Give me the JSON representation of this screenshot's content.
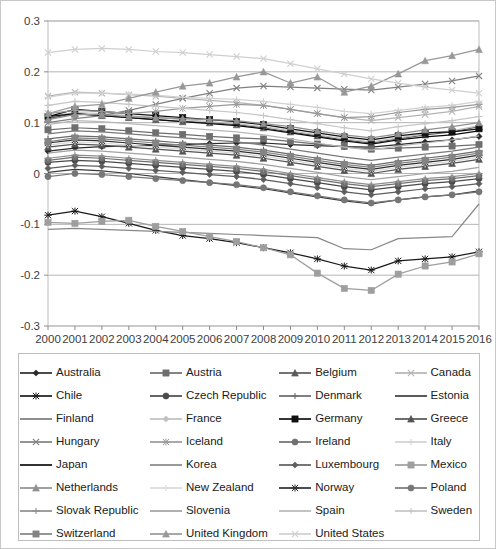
{
  "chart_data": {
    "type": "line",
    "title": "",
    "subtitle": "",
    "xlabel": "",
    "ylabel": "",
    "grid": true,
    "legend_position": "bottom",
    "xlim": [
      2000,
      2016
    ],
    "ylim": [
      -0.3,
      0.3
    ],
    "ytick_labels": [
      "0.3",
      "0.2",
      "0.1",
      "0",
      "-0.1",
      "-0.2",
      "-0.3"
    ],
    "ytick_values": [
      0.3,
      0.2,
      0.1,
      0,
      -0.1,
      -0.2,
      -0.3
    ],
    "categories": [
      2000,
      2001,
      2002,
      2003,
      2004,
      2005,
      2006,
      2007,
      2008,
      2009,
      2010,
      2011,
      2012,
      2013,
      2014,
      2015,
      2016
    ],
    "xtick_labels": [
      "2000",
      "2001",
      "2002",
      "2003",
      "2004",
      "2005",
      "2006",
      "2007",
      "2008",
      "2009",
      "2010",
      "2011",
      "2012",
      "2013",
      "2014",
      "2015",
      "2016"
    ],
    "series": [
      {
        "name": "Australia",
        "marker": "diamond",
        "color": "#2b2b2b",
        "values": [
          0.044,
          0.05,
          0.053,
          0.054,
          0.056,
          0.057,
          0.059,
          0.06,
          0.06,
          0.057,
          0.055,
          0.053,
          0.052,
          0.057,
          0.062,
          0.066,
          0.073
        ]
      },
      {
        "name": "Austria",
        "marker": "square",
        "color": "#6e6e6e",
        "values": [
          0.086,
          0.09,
          0.088,
          0.084,
          0.08,
          0.077,
          0.073,
          0.07,
          0.068,
          0.063,
          0.058,
          0.053,
          0.048,
          0.05,
          0.052,
          0.054,
          0.057
        ]
      },
      {
        "name": "Belgium",
        "marker": "triangle",
        "color": "#5a5a5a",
        "values": [
          0.108,
          0.118,
          0.114,
          0.11,
          0.106,
          0.102,
          0.1,
          0.096,
          0.09,
          0.082,
          0.074,
          0.066,
          0.06,
          0.068,
          0.076,
          0.082,
          0.092
        ]
      },
      {
        "name": "Canada",
        "marker": "x",
        "color": "#b4b4b4",
        "values": [
          0.152,
          0.16,
          0.158,
          0.155,
          0.152,
          0.148,
          0.144,
          0.14,
          0.134,
          0.126,
          0.118,
          0.11,
          0.104,
          0.11,
          0.116,
          0.122,
          0.132
        ]
      },
      {
        "name": "Chile",
        "marker": "star",
        "color": "#1a1a1a",
        "values": [
          -0.082,
          -0.074,
          -0.085,
          -0.098,
          -0.112,
          -0.122,
          -0.128,
          -0.136,
          -0.146,
          -0.156,
          -0.168,
          -0.182,
          -0.19,
          -0.172,
          -0.168,
          -0.164,
          -0.154
        ]
      },
      {
        "name": "Czech Republic",
        "marker": "circle",
        "color": "#4a4a4a",
        "values": [
          0.022,
          0.026,
          0.024,
          0.02,
          0.016,
          0.012,
          0.008,
          0.004,
          -0.002,
          -0.01,
          -0.018,
          -0.026,
          -0.032,
          -0.026,
          -0.02,
          -0.016,
          -0.01
        ]
      },
      {
        "name": "Denmark",
        "marker": "plus",
        "color": "#6a6a6a",
        "values": [
          0.068,
          0.074,
          0.072,
          0.068,
          0.064,
          0.06,
          0.056,
          0.052,
          0.046,
          0.038,
          0.03,
          0.022,
          0.016,
          0.024,
          0.03,
          0.036,
          0.044
        ]
      },
      {
        "name": "Estonia",
        "marker": "none",
        "color": "#3c3c3c",
        "values": [
          0.002,
          0.008,
          0.005,
          0.0,
          -0.006,
          -0.012,
          -0.018,
          -0.024,
          -0.03,
          -0.038,
          -0.046,
          -0.054,
          -0.06,
          -0.052,
          -0.046,
          -0.042,
          -0.034
        ]
      },
      {
        "name": "Finland",
        "marker": "none",
        "color": "#7a7a7a",
        "values": [
          0.078,
          0.084,
          0.082,
          0.078,
          0.074,
          0.07,
          0.066,
          0.062,
          0.056,
          0.048,
          0.04,
          0.032,
          0.026,
          0.032,
          0.038,
          0.044,
          0.052
        ]
      },
      {
        "name": "France",
        "marker": "diamond",
        "color": "#c0c0c0",
        "values": [
          0.112,
          0.12,
          0.118,
          0.114,
          0.11,
          0.106,
          0.102,
          0.098,
          0.092,
          0.084,
          0.076,
          0.068,
          0.062,
          0.07,
          0.078,
          0.084,
          0.094
        ]
      },
      {
        "name": "Germany",
        "marker": "square",
        "color": "#111111",
        "values": [
          0.112,
          0.126,
          0.122,
          0.118,
          0.114,
          0.11,
          0.106,
          0.102,
          0.096,
          0.088,
          0.08,
          0.072,
          0.066,
          0.074,
          0.08,
          0.082,
          0.088
        ]
      },
      {
        "name": "Greece",
        "marker": "triangle",
        "color": "#545454",
        "values": [
          0.052,
          0.058,
          0.056,
          0.052,
          0.048,
          0.044,
          0.04,
          0.036,
          0.03,
          0.022,
          0.014,
          0.006,
          0.0,
          0.008,
          0.014,
          0.02,
          0.028
        ]
      },
      {
        "name": "Hungary",
        "marker": "x",
        "color": "#808080",
        "values": [
          0.1,
          0.108,
          0.114,
          0.124,
          0.136,
          0.148,
          0.158,
          0.168,
          0.172,
          0.17,
          0.168,
          0.166,
          0.164,
          0.17,
          0.176,
          0.182,
          0.192
        ]
      },
      {
        "name": "Iceland",
        "marker": "star",
        "color": "#9a9a9a",
        "values": [
          0.118,
          0.124,
          0.122,
          0.118,
          0.122,
          0.128,
          0.132,
          0.136,
          0.134,
          0.126,
          0.118,
          0.11,
          0.112,
          0.12,
          0.126,
          0.13,
          0.136
        ]
      },
      {
        "name": "Ireland",
        "marker": "circle",
        "color": "#707070",
        "values": [
          0.026,
          0.032,
          0.03,
          0.026,
          0.022,
          0.018,
          0.014,
          0.01,
          0.004,
          -0.004,
          -0.012,
          -0.02,
          -0.026,
          -0.02,
          -0.014,
          -0.01,
          -0.004
        ]
      },
      {
        "name": "Italy",
        "marker": "plus",
        "color": "#d2d2d2",
        "values": [
          0.15,
          0.158,
          0.158,
          0.156,
          0.154,
          0.15,
          0.148,
          0.146,
          0.142,
          0.136,
          0.13,
          0.122,
          0.118,
          0.124,
          0.13,
          0.134,
          0.142
        ]
      },
      {
        "name": "Japan",
        "marker": "none",
        "color": "#0d0d0d",
        "values": [
          0.112,
          0.118,
          0.114,
          0.11,
          0.106,
          0.102,
          0.098,
          0.094,
          0.088,
          0.08,
          0.072,
          0.064,
          0.058,
          0.066,
          0.072,
          0.076,
          0.084
        ]
      },
      {
        "name": "Korea",
        "marker": "none",
        "color": "#888888",
        "values": [
          -0.11,
          -0.108,
          -0.11,
          -0.112,
          -0.114,
          -0.116,
          -0.118,
          -0.12,
          -0.122,
          -0.124,
          -0.126,
          -0.148,
          -0.15,
          -0.128,
          -0.126,
          -0.124,
          -0.06
        ]
      },
      {
        "name": "Luxembourg",
        "marker": "diamond",
        "color": "#5e5e5e",
        "values": [
          0.01,
          0.016,
          0.014,
          0.01,
          0.006,
          0.002,
          -0.002,
          -0.006,
          -0.012,
          -0.02,
          -0.028,
          -0.036,
          -0.042,
          -0.036,
          -0.03,
          -0.026,
          -0.02
        ]
      },
      {
        "name": "Mexico",
        "marker": "square",
        "color": "#9e9e9e",
        "values": [
          -0.096,
          -0.098,
          -0.094,
          -0.092,
          -0.104,
          -0.114,
          -0.124,
          -0.134,
          -0.146,
          -0.16,
          -0.196,
          -0.226,
          -0.23,
          -0.198,
          -0.182,
          -0.174,
          -0.158
        ]
      },
      {
        "name": "Netherlands",
        "marker": "triangle",
        "color": "#909090",
        "values": [
          0.106,
          0.116,
          0.116,
          0.112,
          0.11,
          0.108,
          0.106,
          0.104,
          0.098,
          0.092,
          0.084,
          0.076,
          0.07,
          0.078,
          0.086,
          0.092,
          0.1
        ]
      },
      {
        "name": "New Zealand",
        "marker": "plus",
        "color": "#dadada",
        "values": [
          0.056,
          0.062,
          0.06,
          0.056,
          0.052,
          0.048,
          0.044,
          0.04,
          0.034,
          0.026,
          0.018,
          0.01,
          0.004,
          0.012,
          0.018,
          0.024,
          0.032
        ]
      },
      {
        "name": "Norway",
        "marker": "star",
        "color": "#2e2e2e",
        "values": [
          0.06,
          0.066,
          0.064,
          0.06,
          0.056,
          0.052,
          0.048,
          0.044,
          0.038,
          0.03,
          0.022,
          0.014,
          0.008,
          0.016,
          0.022,
          0.028,
          0.036
        ]
      },
      {
        "name": "Poland",
        "marker": "circle",
        "color": "#767676",
        "values": [
          -0.006,
          0.0,
          -0.002,
          -0.006,
          -0.01,
          -0.014,
          -0.018,
          -0.022,
          -0.028,
          -0.036,
          -0.044,
          -0.052,
          -0.058,
          -0.052,
          -0.046,
          -0.042,
          -0.036
        ]
      },
      {
        "name": "Slovak Republic",
        "marker": "plus",
        "color": "#8e8e8e",
        "values": [
          0.03,
          0.036,
          0.034,
          0.03,
          0.026,
          0.022,
          0.018,
          0.014,
          0.008,
          0.0,
          -0.008,
          -0.016,
          -0.022,
          -0.016,
          -0.01,
          -0.006,
          0.0
        ]
      },
      {
        "name": "Slovenia",
        "marker": "none",
        "color": "#a2a2a2",
        "values": [
          0.04,
          0.046,
          0.044,
          0.04,
          0.036,
          0.032,
          0.028,
          0.024,
          0.018,
          0.01,
          0.002,
          -0.006,
          -0.012,
          -0.006,
          0.0,
          0.004,
          0.012
        ]
      },
      {
        "name": "Spain",
        "marker": "none",
        "color": "#b8b8b8",
        "values": [
          0.096,
          0.104,
          0.102,
          0.098,
          0.094,
          0.09,
          0.086,
          0.082,
          0.076,
          0.068,
          0.06,
          0.052,
          0.046,
          0.054,
          0.06,
          0.066,
          0.074
        ]
      },
      {
        "name": "Sweden",
        "marker": "plus",
        "color": "#c6c6c6",
        "values": [
          0.134,
          0.142,
          0.14,
          0.136,
          0.132,
          0.128,
          0.124,
          0.12,
          0.114,
          0.106,
          0.098,
          0.09,
          0.084,
          0.092,
          0.098,
          0.104,
          0.112
        ]
      },
      {
        "name": "Switzerland",
        "marker": "square",
        "color": "#848484",
        "values": [
          0.062,
          0.07,
          0.068,
          0.064,
          0.06,
          0.056,
          0.052,
          0.048,
          0.042,
          0.034,
          0.026,
          0.018,
          0.012,
          0.02,
          0.026,
          0.032,
          0.04
        ]
      },
      {
        "name": "United Kingdom",
        "marker": "triangle",
        "color": "#989898",
        "values": [
          0.118,
          0.132,
          0.136,
          0.148,
          0.16,
          0.172,
          0.178,
          0.19,
          0.2,
          0.178,
          0.19,
          0.16,
          0.172,
          0.196,
          0.222,
          0.232,
          0.244
        ]
      },
      {
        "name": "United States",
        "marker": "x",
        "color": "#cfcfcf",
        "values": [
          0.238,
          0.244,
          0.246,
          0.244,
          0.24,
          0.238,
          0.234,
          0.23,
          0.226,
          0.216,
          0.206,
          0.196,
          0.186,
          0.178,
          0.17,
          0.164,
          0.158
        ]
      }
    ]
  },
  "legend": {
    "rows": [
      [
        "Australia",
        "Austria",
        "Belgium",
        "Canada"
      ],
      [
        "Chile",
        "Czech Republic",
        "Denmark",
        "Estonia"
      ],
      [
        "Finland",
        "France",
        "Germany",
        "Greece"
      ],
      [
        "Hungary",
        "Iceland",
        "Ireland",
        "Italy"
      ],
      [
        "Japan",
        "Korea",
        "Luxembourg",
        "Mexico"
      ],
      [
        "Netherlands",
        "New Zealand",
        "Norway",
        "Poland"
      ],
      [
        "Slovak Republic",
        "Slovenia",
        "Spain",
        "Sweden"
      ],
      [
        "Switzerland",
        "United Kingdom",
        "United States",
        ""
      ]
    ]
  }
}
